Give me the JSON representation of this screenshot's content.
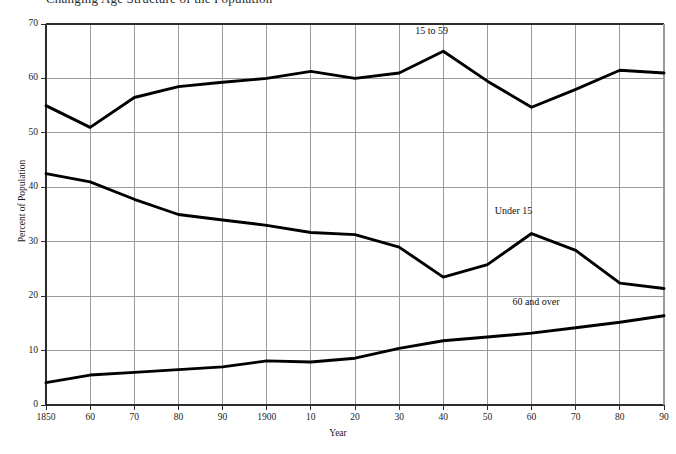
{
  "chart_data": {
    "type": "line",
    "title": "Changing Age Structure of the Population",
    "xlabel": "Year",
    "ylabel": "Percent of Population",
    "grid": true,
    "legend_position": "inline-annotations",
    "xlim": [
      1850,
      1990
    ],
    "ylim": [
      0,
      70
    ],
    "y_ticks": [
      0,
      10,
      20,
      30,
      40,
      50,
      60,
      70
    ],
    "y_tick_labels": [
      "0",
      "10",
      "20",
      "30",
      "40",
      "50",
      "60",
      "70"
    ],
    "x": [
      1850,
      1860,
      1870,
      1880,
      1890,
      1900,
      1910,
      1920,
      1930,
      1940,
      1950,
      1960,
      1970,
      1980,
      1990
    ],
    "x_tick_labels": [
      "1850",
      "60",
      "70",
      "80",
      "90",
      "1900",
      "10",
      "20",
      "30",
      "40",
      "50",
      "60",
      "70",
      "80",
      "90"
    ],
    "series": [
      {
        "name": "15 to 59",
        "color": "#000000",
        "label_x": 1940,
        "label_y": 68.5,
        "values": [
          55.0,
          51.0,
          56.5,
          58.5,
          59.3,
          60.0,
          61.3,
          60.0,
          61.0,
          65.0,
          59.5,
          54.7,
          58.0,
          61.5,
          61.0
        ]
      },
      {
        "name": "Under 15",
        "color": "#000000",
        "label_x": 1958,
        "label_y": 35.5,
        "values": [
          42.5,
          41.0,
          37.8,
          35.0,
          34.0,
          33.0,
          31.7,
          31.3,
          29.0,
          23.5,
          25.8,
          31.5,
          28.4,
          22.4,
          21.4
        ]
      },
      {
        "name": "60 and over",
        "color": "#000000",
        "label_x": 1962,
        "label_y": 18.8,
        "values": [
          4.1,
          5.5,
          6.0,
          6.5,
          7.0,
          8.1,
          7.9,
          8.6,
          10.4,
          11.8,
          12.5,
          13.2,
          14.2,
          15.2,
          16.4
        ]
      }
    ]
  },
  "axes": {
    "y_title": "Percent of Population",
    "x_title": "Year"
  },
  "colors": {
    "line": "#000000",
    "grid": "#9a9a9a",
    "axis": "#2b2b2b",
    "background": "#ffffff",
    "text": "#1a1a1a"
  }
}
